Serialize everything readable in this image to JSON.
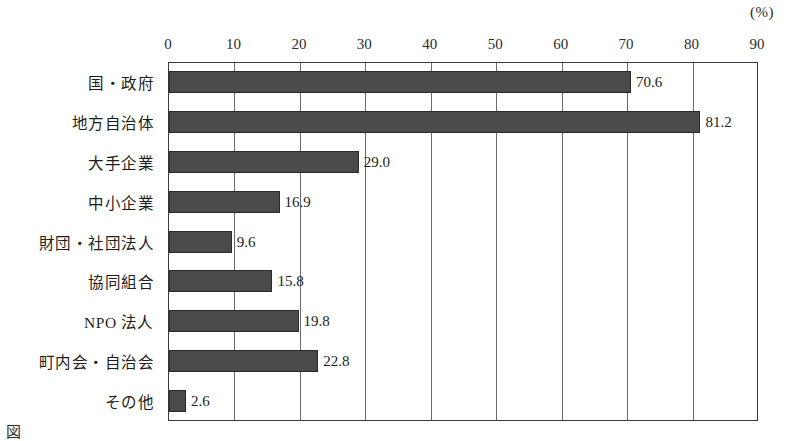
{
  "chart_data": {
    "type": "bar",
    "orientation": "horizontal",
    "title": "",
    "subtitle": "",
    "xlabel": "",
    "ylabel": "",
    "unit_label": "(%)",
    "xlim": [
      0,
      90
    ],
    "xticks": [
      0,
      10,
      20,
      30,
      40,
      50,
      60,
      70,
      80,
      90
    ],
    "grid": true,
    "legend": "none",
    "bar_color": "#4a4a4a",
    "categories": [
      "国・政府",
      "地方自治体",
      "大手企業",
      "中小企業",
      "財団・社団法人",
      "協同組合",
      "NPO 法人",
      "町内会・自治会",
      "その他"
    ],
    "values": [
      70.6,
      81.2,
      29.0,
      16.9,
      9.6,
      15.8,
      19.8,
      22.8,
      2.6
    ],
    "value_labels": [
      "70.6",
      "81.2",
      "29.0",
      "16.9",
      "9.6",
      "15.8",
      "19.8",
      "22.8",
      "2.6"
    ]
  },
  "footer": {
    "caption": "図　　　　　　　　　　　　　　"
  }
}
